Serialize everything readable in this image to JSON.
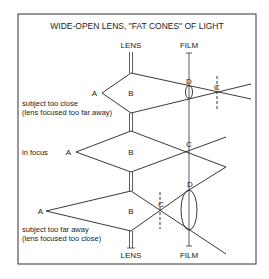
{
  "title": "WIDE-OPEN LENS, \"FAT CONES\" OF LIGHT",
  "labels": {
    "lens": "LENS",
    "film": "FILM",
    "point_a": "A",
    "point_b": "B",
    "point_c": "C",
    "point_d": "D"
  },
  "cases": [
    {
      "caption_line1": "subject too close",
      "caption_line2": "(lens focused too far away)"
    },
    {
      "caption_line1": "in focus",
      "caption_line2": ""
    },
    {
      "caption_line1": "subject too far away",
      "caption_line2": "(lens focused too close)"
    }
  ],
  "colors": {
    "line": "#222222",
    "frame": "#333333",
    "background": "#ffffff"
  }
}
